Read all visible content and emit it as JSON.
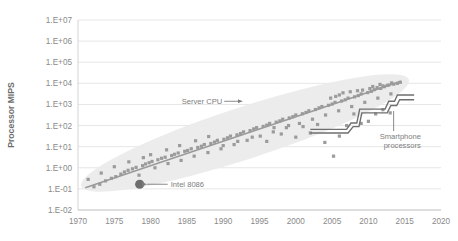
{
  "chart_data": {
    "type": "scatter",
    "title": "",
    "subtitle": "",
    "xlabel": "",
    "ylabel": "Processor MIPS",
    "grid": true,
    "legend_position": "none",
    "xlim": [
      1970,
      2020
    ],
    "ylim_log10": [
      -2,
      7
    ],
    "x_ticks": [
      "1970",
      "1975",
      "1980",
      "1985",
      "1990",
      "1995",
      "2000",
      "2005",
      "2010",
      "2015",
      "2020"
    ],
    "x_tick_values": [
      1970,
      1975,
      1980,
      1985,
      1990,
      1995,
      2000,
      2005,
      2010,
      2015,
      2020
    ],
    "y_ticks": [
      "1.E+07",
      "1.E+06",
      "1.E+05",
      "1.E+04",
      "1.E+03",
      "1.E+02",
      "1.E+01",
      "1.E+00",
      "1.E-01",
      "1.E-02"
    ],
    "y_tick_log10": [
      7,
      6,
      5,
      4,
      3,
      2,
      1,
      0,
      -1,
      -2
    ],
    "colors": {
      "point": "#9b9b9b",
      "trend_line": "#9a9a9a",
      "envelope": "#ebebeb",
      "highlight_point": "#6e6e6e",
      "step_line": "#6f6f6f",
      "grid": "#e6e6e6",
      "axis": "#d8d8d8",
      "text": "#8a8a8a"
    },
    "series": [
      {
        "name": "Processors",
        "type": "scatter",
        "points": [
          [
            1971.4,
            -0.55
          ],
          [
            1972.2,
            -0.9
          ],
          [
            1973.0,
            -0.78
          ],
          [
            1973.8,
            -0.62
          ],
          [
            1974.6,
            -0.5
          ],
          [
            1975.2,
            -0.42
          ],
          [
            1975.9,
            -0.3
          ],
          [
            1976.4,
            -0.2
          ],
          [
            1976.9,
            -0.12
          ],
          [
            1977.5,
            -0.05
          ],
          [
            1978.0,
            0.02
          ],
          [
            1978.4,
            -0.35
          ],
          [
            1978.9,
            0.1
          ],
          [
            1979.3,
            0.18
          ],
          [
            1979.8,
            0.24
          ],
          [
            1980.2,
            0.3
          ],
          [
            1980.6,
            0.0
          ],
          [
            1981.0,
            0.38
          ],
          [
            1981.5,
            0.45
          ],
          [
            1982.0,
            0.5
          ],
          [
            1982.4,
            0.2
          ],
          [
            1982.9,
            0.58
          ],
          [
            1983.3,
            0.64
          ],
          [
            1983.8,
            0.7
          ],
          [
            1984.2,
            0.35
          ],
          [
            1984.7,
            0.78
          ],
          [
            1985.1,
            0.82
          ],
          [
            1985.6,
            0.9
          ],
          [
            1986.0,
            0.55
          ],
          [
            1986.5,
            0.96
          ],
          [
            1987.0,
            1.02
          ],
          [
            1987.4,
            1.1
          ],
          [
            1987.9,
            0.72
          ],
          [
            1988.3,
            1.15
          ],
          [
            1988.8,
            1.22
          ],
          [
            1989.2,
            1.3
          ],
          [
            1989.7,
            0.9
          ],
          [
            1990.1,
            1.35
          ],
          [
            1990.6,
            1.42
          ],
          [
            1991.0,
            1.5
          ],
          [
            1991.5,
            1.1
          ],
          [
            1991.9,
            1.56
          ],
          [
            1992.4,
            1.62
          ],
          [
            1992.8,
            1.7
          ],
          [
            1993.3,
            1.3
          ],
          [
            1993.7,
            1.76
          ],
          [
            1994.2,
            1.84
          ],
          [
            1994.6,
            1.9
          ],
          [
            1995.1,
            1.5
          ],
          [
            1995.5,
            1.96
          ],
          [
            1996.0,
            2.02
          ],
          [
            1996.4,
            2.1
          ],
          [
            1996.9,
            1.7
          ],
          [
            1997.3,
            2.16
          ],
          [
            1997.8,
            2.22
          ],
          [
            1998.2,
            2.3
          ],
          [
            1998.7,
            1.9
          ],
          [
            1999.1,
            2.36
          ],
          [
            1999.6,
            2.42
          ],
          [
            2000.0,
            2.5
          ],
          [
            2000.5,
            2.1
          ],
          [
            2000.9,
            2.56
          ],
          [
            2001.4,
            2.62
          ],
          [
            2001.8,
            2.7
          ],
          [
            2002.3,
            2.3
          ],
          [
            2002.7,
            2.76
          ],
          [
            2003.2,
            2.84
          ],
          [
            2003.6,
            2.9
          ],
          [
            2004.1,
            2.5
          ],
          [
            2004.5,
            2.96
          ],
          [
            2005.0,
            3.02
          ],
          [
            2005.4,
            3.1
          ],
          [
            2005.9,
            2.7
          ],
          [
            2006.3,
            3.16
          ],
          [
            2006.8,
            3.22
          ],
          [
            2007.2,
            3.3
          ],
          [
            2007.7,
            2.9
          ],
          [
            2008.1,
            3.36
          ],
          [
            2008.6,
            3.42
          ],
          [
            2009.0,
            3.5
          ],
          [
            2009.5,
            3.1
          ],
          [
            2009.9,
            3.56
          ],
          [
            2010.4,
            3.62
          ],
          [
            2010.8,
            3.7
          ],
          [
            2011.3,
            3.3
          ],
          [
            2011.7,
            3.76
          ],
          [
            2012.2,
            3.84
          ],
          [
            2012.6,
            3.9
          ],
          [
            2013.1,
            3.5
          ],
          [
            2013.5,
            3.96
          ],
          [
            2014.0,
            4.0
          ],
          [
            2014.4,
            4.05
          ],
          [
            1984.0,
            1.05
          ],
          [
            1986.2,
            1.28
          ],
          [
            1988.0,
            1.48
          ],
          [
            1990.0,
            1.05
          ],
          [
            1992.0,
            1.25
          ],
          [
            1994.0,
            1.45
          ],
          [
            1996.0,
            1.25
          ],
          [
            1998.0,
            1.6
          ],
          [
            2000.0,
            1.45
          ],
          [
            2002.0,
            1.65
          ],
          [
            2004.0,
            1.2
          ],
          [
            2006.0,
            1.5
          ],
          [
            2005.2,
            0.55
          ],
          [
            2003.0,
            2.05
          ],
          [
            2007.0,
            2.0
          ],
          [
            2009.0,
            2.1
          ],
          [
            2011.0,
            2.55
          ],
          [
            2013.0,
            2.6
          ],
          [
            2008.0,
            2.55
          ],
          [
            2010.0,
            2.2
          ],
          [
            2012.0,
            2.75
          ],
          [
            2001.0,
            1.95
          ],
          [
            1999.0,
            2.0
          ],
          [
            1997.0,
            1.9
          ],
          [
            2006.5,
            3.55
          ],
          [
            2007.5,
            3.6
          ],
          [
            2008.5,
            3.65
          ],
          [
            2009.2,
            3.68
          ],
          [
            2010.2,
            3.75
          ],
          [
            2011.2,
            3.8
          ],
          [
            2012.0,
            3.88
          ],
          [
            2012.8,
            3.92
          ],
          [
            2006.0,
            3.45
          ],
          [
            2005.5,
            3.38
          ],
          [
            2004.8,
            3.3
          ],
          [
            2010.6,
            3.85
          ],
          [
            2011.6,
            3.95
          ],
          [
            2013.2,
            4.02
          ],
          [
            1980.0,
            0.62
          ],
          [
            1982.2,
            0.85
          ],
          [
            1977.0,
            0.28
          ],
          [
            1979.0,
            0.48
          ],
          [
            1975.0,
            0.05
          ],
          [
            1973.2,
            -0.25
          ]
        ]
      },
      {
        "name": "Trend line",
        "type": "line",
        "points": [
          [
            1971.0,
            -0.95
          ],
          [
            2014.5,
            4.1
          ]
        ]
      },
      {
        "name": "Smartphone processors (upper)",
        "type": "step",
        "points": [
          [
            2002.0,
            1.82
          ],
          [
            2007.0,
            1.82
          ],
          [
            2007.6,
            2.12
          ],
          [
            2008.4,
            2.12
          ],
          [
            2008.8,
            2.78
          ],
          [
            2012.3,
            2.78
          ],
          [
            2012.8,
            3.15
          ],
          [
            2013.6,
            3.15
          ],
          [
            2014.0,
            3.45
          ],
          [
            2016.3,
            3.45
          ]
        ]
      },
      {
        "name": "Smartphone processors (lower)",
        "type": "step",
        "points": [
          [
            2002.0,
            1.65
          ],
          [
            2007.2,
            1.65
          ],
          [
            2007.9,
            1.95
          ],
          [
            2008.7,
            1.95
          ],
          [
            2009.1,
            2.6
          ],
          [
            2012.6,
            2.6
          ],
          [
            2013.1,
            2.95
          ],
          [
            2013.9,
            2.95
          ],
          [
            2014.3,
            3.22
          ],
          [
            2016.3,
            3.22
          ]
        ]
      }
    ],
    "envelope": {
      "name": "processor-spread-envelope",
      "note": "light gray elliptical band enclosing the scatter cloud"
    },
    "annotations": [
      {
        "name": "server-cpu",
        "label": "Server CPU",
        "arrow": "right",
        "text_x": 1980.5,
        "text_y_log10": 3.15
      },
      {
        "name": "intel-8086",
        "label": "Intel 8086",
        "arrow": "left",
        "text_x": 1985.0,
        "text_y_log10": -0.78,
        "marker_x": 1978.5,
        "marker_y_log10": -0.78,
        "marker_type": "highlight-dot"
      },
      {
        "name": "smartphone-processors",
        "label_line1": "Smartphone",
        "label_line2": "processors",
        "leader": "vertical",
        "text_x": 2013.2,
        "text_y_log10": 1.55
      }
    ]
  }
}
